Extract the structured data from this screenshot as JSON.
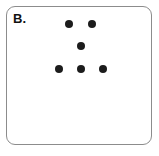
{
  "figure": {
    "panel_label": "B.",
    "panel": {
      "x": 6,
      "y": 6,
      "width": 146,
      "height": 139,
      "corner_radius": 9,
      "border_color": "#8c8c8c",
      "background_color": "#ffffff"
    },
    "dot_color": "#1c1c1c",
    "dot_diameter": 8,
    "dot_count": 6,
    "dots": [
      {
        "name": "dot-top-left",
        "x": 69,
        "y": 24,
        "d": 8
      },
      {
        "name": "dot-top-right",
        "x": 92,
        "y": 24,
        "d": 8
      },
      {
        "name": "dot-middle",
        "x": 81,
        "y": 46,
        "d": 8
      },
      {
        "name": "dot-bottom-left",
        "x": 59,
        "y": 69,
        "d": 8
      },
      {
        "name": "dot-bottom-mid",
        "x": 81,
        "y": 69,
        "d": 8
      },
      {
        "name": "dot-bottom-right",
        "x": 103,
        "y": 69,
        "d": 8
      }
    ]
  },
  "chart_data": {
    "type": "scatter",
    "title": "B.",
    "xlabel": "",
    "ylabel": "",
    "grid": false,
    "legend": null,
    "marker": {
      "shape": "circle",
      "color": "#1c1c1c",
      "size_px": 8
    },
    "xlim": [
      6,
      152
    ],
    "ylim": [
      6,
      145
    ],
    "note": "Pixel coordinates, y measured downward from top of image",
    "points": [
      {
        "x": 69,
        "y": 24
      },
      {
        "x": 92,
        "y": 24
      },
      {
        "x": 81,
        "y": 46
      },
      {
        "x": 59,
        "y": 69
      },
      {
        "x": 81,
        "y": 69
      },
      {
        "x": 103,
        "y": 69
      }
    ]
  }
}
